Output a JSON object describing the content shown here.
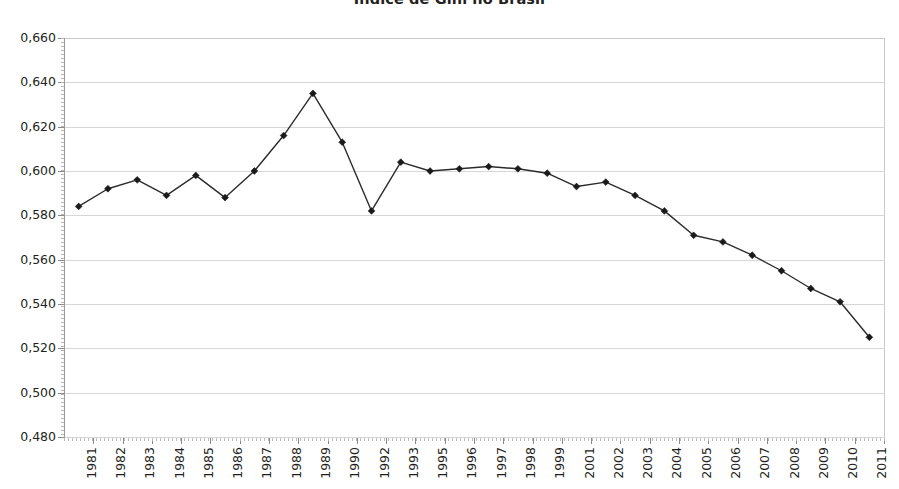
{
  "chart_data": {
    "type": "line",
    "title": "Índice de Gini no Brasil",
    "xlabel": "",
    "ylabel": "",
    "ylim": [
      0.48,
      0.66
    ],
    "ytick_step": 0.02,
    "ytick_labels": [
      "0,660",
      "0,640",
      "0,620",
      "0,600",
      "0,580",
      "0,560",
      "0,540",
      "0,520",
      "0,500",
      "0,480"
    ],
    "ytick_values": [
      0.66,
      0.64,
      0.62,
      0.6,
      0.58,
      0.56,
      0.54,
      0.52,
      0.5,
      0.48
    ],
    "grid": true,
    "legend": "none",
    "decimal_separator": ",",
    "categories": [
      "1981",
      "1982",
      "1983",
      "1984",
      "1985",
      "1986",
      "1987",
      "1988",
      "1989",
      "1990",
      "1992",
      "1993",
      "1995",
      "1996",
      "1997",
      "1998",
      "1999",
      "2001",
      "2002",
      "2003",
      "2004",
      "2005",
      "2006",
      "2007",
      "2008",
      "2009",
      "2010",
      "2011"
    ],
    "series": [
      {
        "name": "Índice de Gini",
        "marker": "diamond",
        "color": "#1a1a1a",
        "values": [
          0.584,
          0.592,
          0.596,
          0.589,
          0.598,
          0.588,
          0.6,
          0.616,
          0.635,
          0.613,
          0.582,
          0.604,
          0.6,
          0.601,
          0.602,
          0.601,
          0.599,
          0.593,
          0.595,
          0.589,
          0.582,
          0.571,
          0.568,
          0.562,
          0.555,
          0.547,
          0.541,
          0.525
        ]
      }
    ]
  },
  "axis": {
    "y_axis_name": "y-axis",
    "x_axis_name": "x-axis"
  }
}
